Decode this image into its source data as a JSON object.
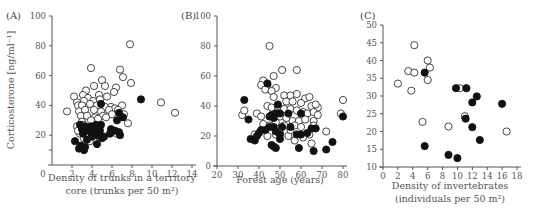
{
  "chart_data": [
    {
      "panel": "(A)",
      "type": "scatter",
      "ylabel": "Corticosterone [ng/ml⁻¹]",
      "xlabel_lines": [
        "Density of trunks in a territory",
        "core (trunks per 50 m²)"
      ],
      "xlim": [
        0,
        14
      ],
      "ylim": [
        0,
        100
      ],
      "xticks": [
        0,
        2,
        4,
        6,
        8,
        10,
        12,
        14
      ],
      "xtick_labels": [
        "0",
        "2",
        "4",
        "6",
        "8",
        "10",
        "12",
        "14"
      ],
      "yticks": [
        20,
        40,
        60,
        80,
        100
      ],
      "ytick_labels": [
        "20",
        "40",
        "60",
        "80",
        "100"
      ],
      "series": [
        {
          "name": "open",
          "marker": "open-circle",
          "points": [
            [
              7.8,
              81
            ],
            [
              3.9,
              65
            ],
            [
              6.8,
              64
            ],
            [
              7.1,
              59
            ],
            [
              5.0,
              57
            ],
            [
              7.9,
              55
            ],
            [
              4.2,
              53
            ],
            [
              5.3,
              53
            ],
            [
              6.4,
              52
            ],
            [
              3.4,
              50
            ],
            [
              6.2,
              49
            ],
            [
              2.2,
              46
            ],
            [
              3.1,
              47
            ],
            [
              4.7,
              47
            ],
            [
              5.5,
              46
            ],
            [
              3.6,
              45
            ],
            [
              2.5,
              42
            ],
            [
              3.2,
              43
            ],
            [
              4.1,
              43
            ],
            [
              4.8,
              44
            ],
            [
              10.9,
              42
            ],
            [
              2.6,
              40
            ],
            [
              3.0,
              40
            ],
            [
              3.8,
              41
            ],
            [
              4.5,
              40
            ],
            [
              5.3,
              39
            ],
            [
              5.9,
              39
            ],
            [
              6.3,
              38
            ],
            [
              7.0,
              40
            ],
            [
              1.5,
              36
            ],
            [
              2.7,
              36
            ],
            [
              3.3,
              37
            ],
            [
              4.2,
              37
            ],
            [
              4.9,
              36
            ],
            [
              5.7,
              37
            ],
            [
              6.6,
              37
            ],
            [
              7.2,
              34
            ],
            [
              12.3,
              35
            ],
            [
              2.9,
              33
            ],
            [
              3.5,
              33
            ],
            [
              4.3,
              32
            ],
            [
              5.1,
              33
            ],
            [
              6.0,
              34
            ],
            [
              3.0,
              29
            ],
            [
              3.9,
              30
            ],
            [
              4.6,
              31
            ],
            [
              5.4,
              32
            ],
            [
              7.6,
              28
            ],
            [
              2.5,
              26
            ],
            [
              3.4,
              24
            ],
            [
              4.1,
              25
            ],
            [
              2.8,
              21
            ],
            [
              3.6,
              20
            ],
            [
              4.4,
              21
            ],
            [
              6.5,
              21
            ],
            [
              3.2,
              18
            ],
            [
              3.8,
              16
            ],
            [
              4.7,
              19
            ],
            [
              2.6,
              23
            ],
            [
              3.1,
              27
            ]
          ]
        },
        {
          "name": "filled",
          "marker": "filled-circle",
          "points": [
            [
              4.9,
              41
            ],
            [
              8.9,
              44
            ],
            [
              6.7,
              35
            ],
            [
              7.1,
              32
            ],
            [
              6.5,
              30
            ],
            [
              2.8,
              27
            ],
            [
              3.3,
              26
            ],
            [
              3.9,
              26
            ],
            [
              4.4,
              27
            ],
            [
              4.9,
              27
            ],
            [
              3.0,
              24
            ],
            [
              3.6,
              23
            ],
            [
              4.2,
              24
            ],
            [
              4.8,
              23
            ],
            [
              5.9,
              24
            ],
            [
              6.3,
              23
            ],
            [
              6.7,
              22
            ],
            [
              3.1,
              21
            ],
            [
              4.0,
              21
            ],
            [
              4.5,
              20
            ],
            [
              5.8,
              21
            ],
            [
              6.8,
              20
            ],
            [
              4.0,
              19
            ],
            [
              5.0,
              18
            ],
            [
              3.5,
              17
            ],
            [
              2.3,
              16
            ],
            [
              2.9,
              13
            ],
            [
              3.3,
              12
            ],
            [
              2.7,
              11
            ],
            [
              3.2,
              10
            ],
            [
              4.5,
              14
            ],
            [
              5.2,
              19
            ]
          ]
        }
      ]
    },
    {
      "panel": "(B)",
      "type": "scatter",
      "ylabel": "",
      "xlabel_lines": [
        "Forest age (years)"
      ],
      "xlim": [
        20,
        80
      ],
      "ylim": [
        0,
        100
      ],
      "xticks": [
        20,
        30,
        40,
        50,
        60,
        70,
        80
      ],
      "xtick_labels": [
        "20",
        "30",
        "40",
        "50",
        "60",
        "70",
        "80"
      ],
      "yticks": [
        0,
        20,
        40,
        60,
        80,
        100
      ],
      "ytick_labels": [
        "0",
        "20",
        "40",
        "60",
        "80",
        "100"
      ],
      "series": [
        {
          "name": "open",
          "marker": "open-circle",
          "points": [
            [
              45,
              80
            ],
            [
              51,
              64
            ],
            [
              58,
              64
            ],
            [
              42,
              57
            ],
            [
              47,
              60
            ],
            [
              44,
              54
            ],
            [
              48,
              52
            ],
            [
              41,
              54
            ],
            [
              43,
              51
            ],
            [
              46,
              50
            ],
            [
              52,
              47
            ],
            [
              55,
              47
            ],
            [
              58,
              48
            ],
            [
              62,
              45
            ],
            [
              64,
              46
            ],
            [
              80,
              44
            ],
            [
              47,
              46
            ],
            [
              53,
              43
            ],
            [
              56,
              43
            ],
            [
              60,
              42
            ],
            [
              65,
              40
            ],
            [
              68,
              39
            ],
            [
              44,
              40
            ],
            [
              46,
              39
            ],
            [
              49,
              40
            ],
            [
              52,
              38
            ],
            [
              55,
              38
            ],
            [
              58,
              37
            ],
            [
              61,
              36
            ],
            [
              63,
              35
            ],
            [
              66,
              36
            ],
            [
              67,
              41
            ],
            [
              32,
              34
            ],
            [
              33,
              37
            ],
            [
              39,
              35
            ],
            [
              41,
              33
            ],
            [
              50,
              33
            ],
            [
              53,
              32
            ],
            [
              56,
              30
            ],
            [
              59,
              30
            ],
            [
              62,
              31
            ],
            [
              66,
              30
            ],
            [
              68,
              34
            ],
            [
              79,
              35
            ],
            [
              42,
              28
            ],
            [
              45,
              27
            ],
            [
              48,
              29
            ],
            [
              52,
              27
            ],
            [
              57,
              27
            ],
            [
              60,
              26
            ],
            [
              66,
              27
            ],
            [
              38,
              21
            ],
            [
              44,
              20
            ],
            [
              48,
              21
            ],
            [
              54,
              20
            ],
            [
              57,
              17
            ],
            [
              61,
              19
            ],
            [
              64,
              21
            ],
            [
              65,
              15
            ],
            [
              72,
              23
            ],
            [
              50,
              22
            ],
            [
              55,
              24
            ]
          ]
        },
        {
          "name": "filled",
          "marker": "filled-circle",
          "points": [
            [
              33,
              44
            ],
            [
              44,
              55
            ],
            [
              49,
              41
            ],
            [
              46,
              34
            ],
            [
              48,
              35
            ],
            [
              50,
              35
            ],
            [
              47,
              32
            ],
            [
              45,
              33
            ],
            [
              54,
              35
            ],
            [
              60,
              35
            ],
            [
              80,
              33
            ],
            [
              35,
              31
            ],
            [
              45,
              26
            ],
            [
              43,
              24
            ],
            [
              41,
              24
            ],
            [
              47,
              26
            ],
            [
              51,
              26
            ],
            [
              48,
              23
            ],
            [
              40,
              22
            ],
            [
              39,
              20
            ],
            [
              36,
              18
            ],
            [
              38,
              17
            ],
            [
              50,
              21
            ],
            [
              50,
              18
            ],
            [
              58,
              21
            ],
            [
              60,
              21
            ],
            [
              63,
              22
            ],
            [
              65,
              25
            ],
            [
              67,
              25
            ],
            [
              59,
              12
            ],
            [
              66,
              10
            ],
            [
              72,
              11
            ],
            [
              75,
              16
            ],
            [
              47,
              13
            ],
            [
              48,
              12
            ],
            [
              46,
              14
            ],
            [
              55,
              26
            ]
          ]
        }
      ]
    },
    {
      "panel": "(C)",
      "type": "scatter",
      "ylabel": "",
      "xlabel_lines": [
        "Density of invertebrates",
        "(individuals per 50 m²)"
      ],
      "xlim": [
        0,
        18
      ],
      "ylim": [
        10,
        50
      ],
      "xticks": [
        0,
        2,
        4,
        6,
        8,
        10,
        12,
        14,
        16,
        18
      ],
      "xtick_labels": [
        "0",
        "2",
        "4",
        "6",
        "8",
        "10",
        "12",
        "14",
        "16",
        "18"
      ],
      "yticks": [
        10,
        15,
        20,
        25,
        30,
        35,
        40,
        45,
        50
      ],
      "ytick_labels": [
        "10",
        "15",
        "20",
        "25",
        "30",
        "35",
        "40",
        "45",
        "50"
      ],
      "series": [
        {
          "name": "open",
          "marker": "open-circle",
          "points": [
            [
              4.2,
              44.3
            ],
            [
              6.0,
              40.0
            ],
            [
              6.3,
              38.0
            ],
            [
              3.4,
              37.0
            ],
            [
              4.2,
              36.6
            ],
            [
              6.0,
              34.5
            ],
            [
              2.0,
              33.5
            ],
            [
              3.8,
              31.5
            ],
            [
              10.3,
              32.2
            ],
            [
              11.0,
              24.3
            ],
            [
              5.3,
              22.7
            ],
            [
              8.8,
              21.4
            ],
            [
              16.6,
              20.0
            ]
          ]
        },
        {
          "name": "filled",
          "marker": "filled-circle",
          "points": [
            [
              5.6,
              36.6
            ],
            [
              9.8,
              32.2
            ],
            [
              11.2,
              32.2
            ],
            [
              12.6,
              29.9
            ],
            [
              12.0,
              28.2
            ],
            [
              16.0,
              27.8
            ],
            [
              11.1,
              23.6
            ],
            [
              12.0,
              21.2
            ],
            [
              13.0,
              17.6
            ],
            [
              5.6,
              15.9
            ],
            [
              8.8,
              13.4
            ],
            [
              10.0,
              12.5
            ]
          ]
        }
      ]
    }
  ]
}
